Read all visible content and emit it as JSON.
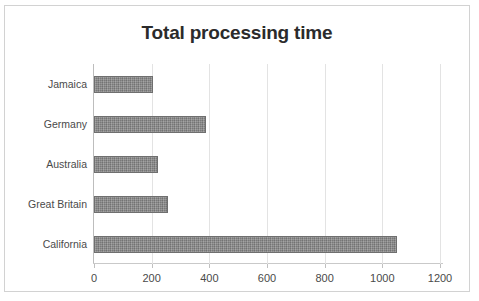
{
  "chart_data": {
    "type": "bar",
    "orientation": "horizontal",
    "title": "Total processing time",
    "xlabel": "",
    "ylabel": "",
    "categories": [
      "Jamaica",
      "Germany",
      "Australia",
      "Great Britain",
      "California"
    ],
    "values": [
      205,
      388,
      222,
      256,
      1050
    ],
    "xlim": [
      0,
      1200
    ],
    "xticks": [
      0,
      200,
      400,
      600,
      800,
      1000,
      1200
    ],
    "xtick_labels": [
      "0",
      "200",
      "400",
      "600",
      "800",
      "1000",
      "1200"
    ],
    "grid": true,
    "legend": false,
    "series": [
      {
        "name": "Total processing time",
        "values": [
          205,
          388,
          222,
          256,
          1050
        ],
        "color": "#8a8a8a"
      }
    ],
    "colors": {
      "bar_fill": "#8a8a8a",
      "bar_border": "#6f6f6f",
      "gridline": "#e3e3e3",
      "axis": "#bdbdbd",
      "title_text": "#2b2b2b",
      "label_text": "#4a4a4a",
      "frame_border": "#d2d2d2",
      "background": "#ffffff"
    }
  }
}
